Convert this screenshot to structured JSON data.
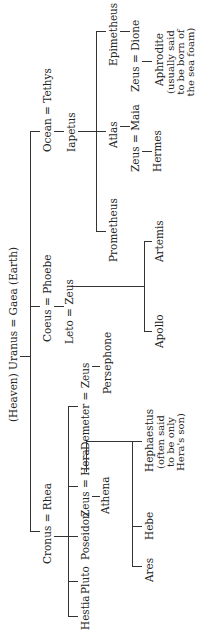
{
  "root": {
    "left": "(Heaven) Uranus",
    "eq": "=",
    "right": "Gaea (Earth)"
  },
  "gen1": {
    "cronus": "Cronus = Rhea",
    "coeus": "Coeus = Phoebe",
    "ocean": "Ocean = Tethys"
  },
  "cronus_children": [
    "Hestia",
    "Pluto",
    "Poseidon",
    "Zeus = Hera",
    "Demeter = Zeus"
  ],
  "hera_children": [
    "Ares",
    "Hebe",
    "Hephaestus"
  ],
  "hephaestus_note": [
    "(often said",
    "to be only",
    "Hera's son)"
  ],
  "athena": "Athena",
  "persephone": "Persephone",
  "leto": "Leto = Zeus",
  "leto_children": [
    "Apollo",
    "Artemis"
  ],
  "iapetus": "Iapetus",
  "iapetus_children": [
    "Prometheus",
    "Atlas",
    "Epimetheus"
  ],
  "maia": "Zeus = Maia",
  "hermes": "Hermes",
  "dione": "Zeus = Dione",
  "aphrodite": "Aphrodite",
  "aphrodite_note": [
    "(usually said",
    "to be born of",
    "the sea foam)"
  ]
}
